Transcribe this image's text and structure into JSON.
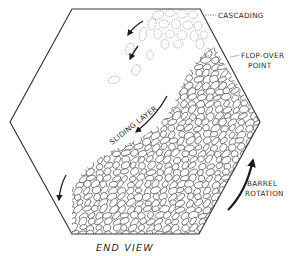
{
  "diagram": {
    "title": "END VIEW",
    "labels": {
      "cascading": "CASCADING",
      "flop_over_line1": "FLOP-OVER",
      "flop_over_line2": "POINT",
      "sliding_layer": "SLIDING LAYER",
      "barrel_line1": "BARREL",
      "barrel_line2": "ROTATION"
    },
    "colors": {
      "line": "#3a3a3a",
      "particle_stroke": "#555555",
      "background": "#ffffff"
    },
    "hexagon_vertices": [
      [
        72,
        9
      ],
      [
        200,
        9
      ],
      [
        260,
        122
      ],
      [
        199,
        234
      ],
      [
        72,
        234
      ],
      [
        10,
        122
      ]
    ]
  }
}
